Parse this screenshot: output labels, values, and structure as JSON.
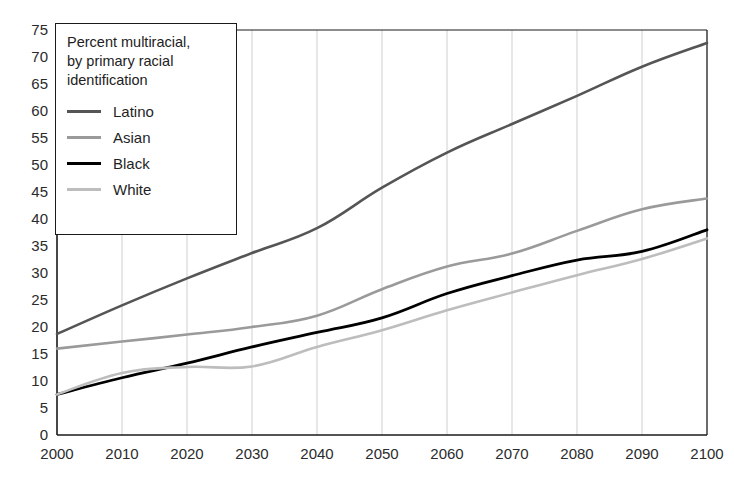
{
  "chart_data": {
    "type": "line",
    "title": "",
    "legend_title": "Percent multiracial,\nby primary racial\nidentification",
    "legend_position": "top-left-inside",
    "grid": true,
    "xlabel": "",
    "ylabel": "",
    "xlim": [
      2000,
      2100
    ],
    "ylim": [
      0,
      75
    ],
    "x": [
      2000,
      2010,
      2020,
      2030,
      2040,
      2050,
      2060,
      2070,
      2080,
      2090,
      2100
    ],
    "xticklabels": [
      "2000",
      "2010",
      "2020",
      "2030",
      "2040",
      "2050",
      "2060",
      "2070",
      "2080",
      "2090",
      "2100"
    ],
    "yticks": [
      0,
      5,
      10,
      15,
      20,
      25,
      30,
      35,
      40,
      45,
      50,
      55,
      60,
      65,
      70,
      75
    ],
    "yticklabels": [
      "0",
      "5",
      "10",
      "15",
      "20",
      "25",
      "30",
      "35",
      "40",
      "45",
      "50",
      "55",
      "60",
      "65",
      "70",
      "75"
    ],
    "series": [
      {
        "name": "Latino",
        "color": "#555555",
        "width": 2.6,
        "values": [
          18.7,
          24.0,
          29.0,
          33.7,
          38.3,
          45.8,
          52.3,
          57.6,
          62.8,
          68.2,
          72.6
        ]
      },
      {
        "name": "Asian",
        "color": "#9a9a9a",
        "width": 2.6,
        "values": [
          16.0,
          17.3,
          18.6,
          20.0,
          22.1,
          27.0,
          31.2,
          33.6,
          37.8,
          41.8,
          43.8
        ]
      },
      {
        "name": "Black",
        "color": "#000000",
        "width": 2.8,
        "values": [
          7.5,
          10.6,
          13.3,
          16.3,
          19.0,
          21.7,
          26.2,
          29.5,
          32.4,
          34.0,
          38.0
        ]
      },
      {
        "name": "White",
        "color": "#bdbdbd",
        "width": 2.6,
        "values": [
          7.5,
          11.5,
          12.6,
          12.7,
          16.3,
          19.4,
          23.1,
          26.4,
          29.6,
          32.6,
          36.4
        ]
      }
    ]
  },
  "colors": {
    "axis": "#1a1a1a",
    "grid": "#cfcfcf",
    "tick_text": "#2b2b2b",
    "background": "#ffffff"
  },
  "legend": {
    "title": "Percent multiracial,\nby primary racial\nidentification",
    "items": [
      {
        "label": "Latino",
        "color": "#555555",
        "thickness": "3px"
      },
      {
        "label": "Asian",
        "color": "#9a9a9a",
        "thickness": "3px"
      },
      {
        "label": "Black",
        "color": "#000000",
        "thickness": "3.4px"
      },
      {
        "label": "White",
        "color": "#bdbdbd",
        "thickness": "2.6px"
      }
    ]
  }
}
